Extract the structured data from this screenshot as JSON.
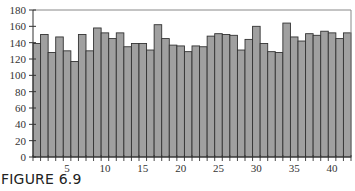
{
  "figure": {
    "caption": "FIGURE 6.9"
  },
  "chart_data": {
    "type": "bar",
    "title": "",
    "xlabel": "",
    "ylabel": "",
    "categories": [
      1,
      2,
      3,
      4,
      5,
      6,
      7,
      8,
      9,
      10,
      11,
      12,
      13,
      14,
      15,
      16,
      17,
      18,
      19,
      20,
      21,
      22,
      23,
      24,
      25,
      26,
      27,
      28,
      29,
      30,
      31,
      32,
      33,
      34,
      35,
      36,
      37,
      38,
      39,
      40,
      41,
      42
    ],
    "values": [
      139,
      150,
      128,
      147,
      130,
      117,
      150,
      130,
      158,
      152,
      145,
      152,
      135,
      139,
      139,
      131,
      162,
      145,
      137,
      136,
      129,
      136,
      135,
      148,
      151,
      150,
      149,
      131,
      144,
      160,
      139,
      129,
      128,
      164,
      147,
      142,
      151,
      149,
      154,
      152,
      145,
      152
    ],
    "ylim": [
      0,
      180
    ],
    "yticks": [
      0,
      20,
      40,
      60,
      80,
      100,
      120,
      140,
      160,
      180
    ],
    "xtick_labels": [
      5,
      10,
      15,
      20,
      25,
      30,
      35,
      40
    ],
    "grid": false,
    "legend": null,
    "bar_color": "#a0a0a0",
    "bar_edge_color": "#333333"
  }
}
